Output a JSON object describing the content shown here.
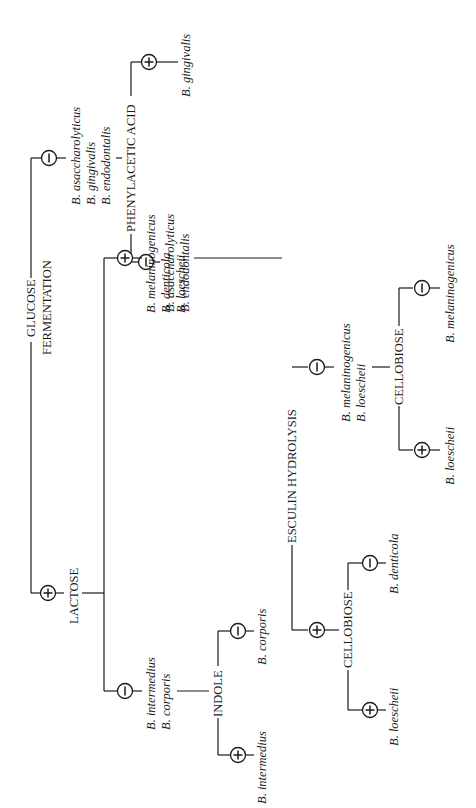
{
  "diagram": {
    "orientation": "rotated -90deg",
    "root_test": {
      "line1": "GLUCOSE",
      "line2": "FERMENTATION"
    },
    "glucose_negative": {
      "sign": "−",
      "species": [
        "B. asaccharolyticus",
        "B. gingivalis",
        "B. endodontalis"
      ],
      "test": "PHENYLACETIC ACID",
      "positive": {
        "sign": "+",
        "species": [
          "B. gingivalis"
        ]
      },
      "negative": {
        "sign": "−",
        "species": [
          "B. asaccharolyticus",
          "B. endodontalis"
        ]
      }
    },
    "glucose_positive": {
      "sign": "+",
      "test": "LACTOSE",
      "lactose_negative": {
        "sign": "−",
        "species": [
          "B. intermedius",
          "B. corporis"
        ],
        "test": "INDOLE",
        "positive": {
          "sign": "+",
          "species": [
            "B. intermedius"
          ]
        },
        "negative": {
          "sign": "−",
          "species": [
            "B. corporis"
          ]
        }
      },
      "lactose_positive": {
        "sign": "+",
        "species": [
          "B. melaninogenicus",
          "B. denticola",
          "B. loescheii"
        ],
        "test": "ESCULIN HYDROLYSIS",
        "esculin_positive": {
          "sign": "+",
          "test": "CELLOBIOSE",
          "positive": {
            "sign": "+",
            "species": [
              "B. loescheii"
            ]
          },
          "negative": {
            "sign": "−",
            "species": [
              "B. denticola"
            ]
          }
        },
        "esculin_negative": {
          "sign": "−",
          "species": [
            "B. melaninogenicus",
            "B. loescheii"
          ],
          "test": "CELLOBIOSE",
          "positive": {
            "sign": "+",
            "species": [
              "B. loescheii"
            ]
          },
          "negative": {
            "sign": "−",
            "species": [
              "B. melaninogenicus"
            ]
          }
        }
      }
    }
  }
}
